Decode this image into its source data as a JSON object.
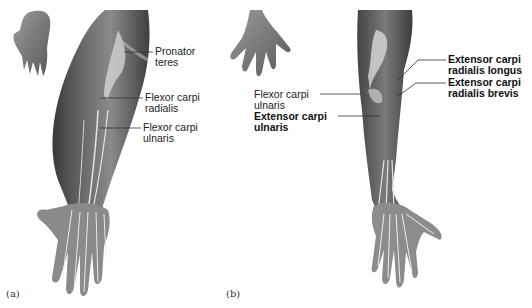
{
  "figure": {
    "panels": [
      {
        "id": "a",
        "letter": "(a)",
        "labels": [
          {
            "line1": "Pronator",
            "line2": "teres",
            "bold": false
          },
          {
            "line1": "Flexor carpi",
            "line2": "radialis",
            "bold": false
          },
          {
            "line1": "Flexor carpi",
            "line2": "ulnaris",
            "bold": false
          }
        ]
      },
      {
        "id": "b",
        "letter": "(b)",
        "labels": [
          {
            "line1": "Flexor carpi",
            "line2": "ulnaris",
            "bold": false
          },
          {
            "line1": "Extensor carpi",
            "line2": "ulnaris",
            "bold": true
          },
          {
            "line1": "Extensor carpi",
            "line2": "radialis longus",
            "bold": true
          },
          {
            "line1": "Extensor carpi",
            "line2": "radialis brevis",
            "bold": true
          }
        ]
      }
    ]
  }
}
